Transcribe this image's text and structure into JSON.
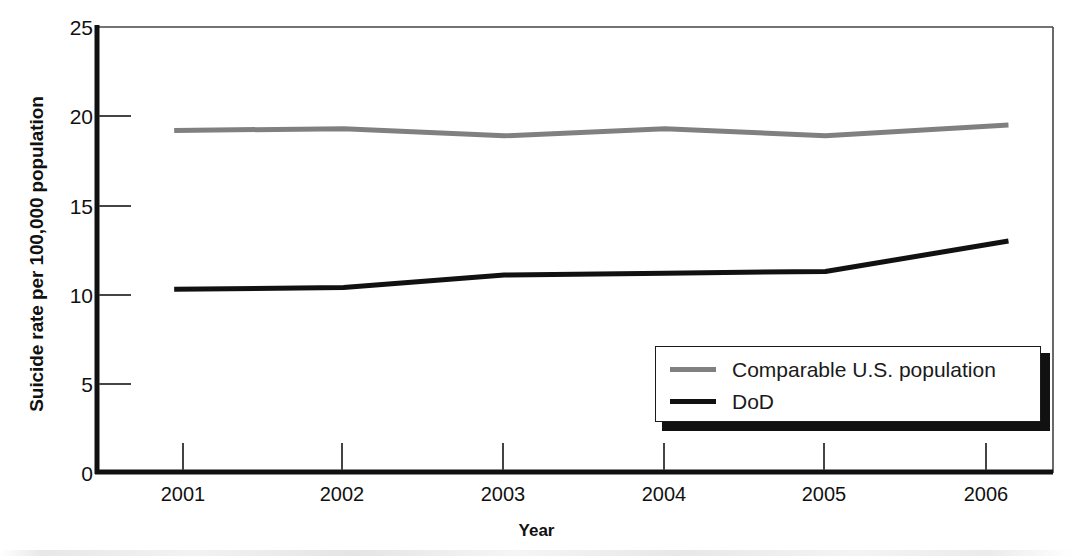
{
  "chart_data": {
    "type": "line",
    "title": "",
    "xlabel": "Year",
    "ylabel": "Suicide rate per 100,000 population",
    "categories": [
      "2001",
      "2002",
      "2003",
      "2004",
      "2005",
      "2006"
    ],
    "x": [
      2001,
      2002,
      2003,
      2004,
      2005,
      2006
    ],
    "xlim": [
      2000.75,
      2006.45
    ],
    "ylim": [
      0,
      25
    ],
    "yticks": [
      0,
      5,
      10,
      15,
      20,
      25
    ],
    "ytick_labels": [
      "0",
      "5",
      "10",
      "15",
      "20",
      "25"
    ],
    "xticks": [
      2001,
      2002,
      2003,
      2004,
      2005,
      2006
    ],
    "xtick_labels": [
      "2001",
      "2002",
      "2003",
      "2004",
      "2005",
      "2006"
    ],
    "grid": false,
    "legend_position": "lower right",
    "series": [
      {
        "name": "Comparable U.S. population",
        "color": "#808080",
        "values": [
          19.2,
          19.3,
          18.9,
          19.3,
          18.9,
          19.5
        ]
      },
      {
        "name": "DoD",
        "color": "#111111",
        "values": [
          10.3,
          10.4,
          11.1,
          11.2,
          11.3,
          13.0
        ]
      }
    ]
  },
  "axis": {
    "y_title": "Suicide rate per 100,000 population",
    "x_title": "Year"
  },
  "legend": {
    "entries": [
      {
        "label": "Comparable U.S. population",
        "color": "#808080"
      },
      {
        "label": "DoD",
        "color": "#111111"
      }
    ]
  },
  "colors": {
    "comparable_us": "#808080",
    "dod": "#111111",
    "axis": "#111111",
    "background": "#ffffff"
  }
}
